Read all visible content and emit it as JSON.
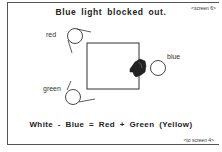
{
  "title": "Blue light blocked out.",
  "nav": {
    "current_screen": "<screen 6>",
    "next_link": "<to screen 4>"
  },
  "lamps": [
    {
      "label": "red",
      "color_name": "red"
    },
    {
      "label": "blue",
      "color_name": "blue"
    },
    {
      "label": "green",
      "color_name": "green"
    }
  ],
  "blocker": {
    "icon": "hand-icon",
    "blocks": "blue"
  },
  "equation": "White - Blue = Red + Green (Yellow)"
}
